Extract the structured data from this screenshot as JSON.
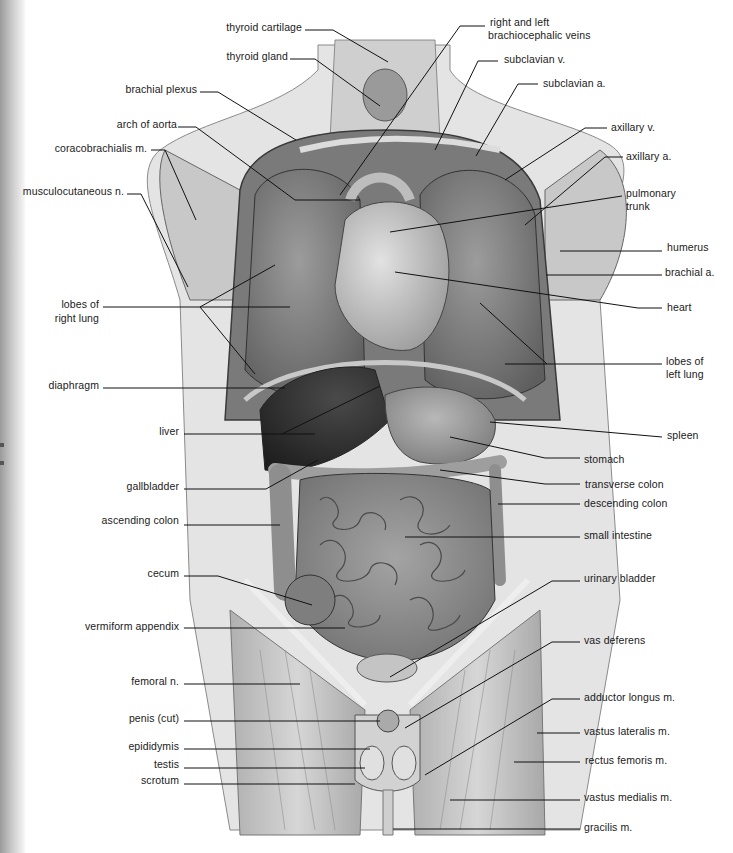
{
  "diagram": {
    "type": "anatomical illustration",
    "colors": {
      "background": "#ffffff",
      "ink": "#1a1a1a",
      "organ_fill": "#8a8a8a",
      "skin": "#d8d8d8"
    }
  },
  "labels_left": [
    {
      "id": "thyroid-cartilage",
      "text": "thyroid cartilage",
      "x": 250,
      "y": 27
    },
    {
      "id": "thyroid-gland",
      "text": "thyroid gland",
      "x": 240,
      "y": 56
    },
    {
      "id": "brachial-plexus",
      "text": "brachial plexus",
      "x": 196,
      "y": 89
    },
    {
      "id": "arch-of-aorta",
      "text": "arch of aorta",
      "x": 176,
      "y": 124
    },
    {
      "id": "coracobrachialis",
      "text": "coracobrachialis m.",
      "x": 146,
      "y": 148
    },
    {
      "id": "musculocutaneous",
      "text": "musculocutaneous n.",
      "x": 124,
      "y": 191
    },
    {
      "id": "lobes-right-lung-1",
      "text": "lobes of",
      "x": 99,
      "y": 304
    },
    {
      "id": "lobes-right-lung-2",
      "text": "right lung",
      "x": 99,
      "y": 318
    },
    {
      "id": "diaphragm",
      "text": "diaphragm",
      "x": 99,
      "y": 385
    },
    {
      "id": "liver",
      "text": "liver",
      "x": 178,
      "y": 431
    },
    {
      "id": "gallbladder",
      "text": "gallbladder",
      "x": 178,
      "y": 486
    },
    {
      "id": "ascending-colon",
      "text": "ascending colon",
      "x": 178,
      "y": 520
    },
    {
      "id": "cecum",
      "text": "cecum",
      "x": 178,
      "y": 573
    },
    {
      "id": "vermiform-appendix",
      "text": "vermiform appendix",
      "x": 178,
      "y": 626
    },
    {
      "id": "femoral-n",
      "text": "femoral n.",
      "x": 178,
      "y": 681
    },
    {
      "id": "penis-cut",
      "text": "penis (cut)",
      "x": 178,
      "y": 718
    },
    {
      "id": "epididymis",
      "text": "epididymis",
      "x": 178,
      "y": 746
    },
    {
      "id": "testis",
      "text": "testis",
      "x": 178,
      "y": 764
    },
    {
      "id": "scrotum",
      "text": "scrotum",
      "x": 178,
      "y": 780
    }
  ],
  "labels_right": [
    {
      "id": "brachiocephalic-veins-1",
      "text": "right and left",
      "x": 490,
      "y": 17
    },
    {
      "id": "brachiocephalic-veins-2",
      "text": "brachiocephalic veins",
      "x": 488,
      "y": 30
    },
    {
      "id": "subclavian-v",
      "text": "subclavian v.",
      "x": 504,
      "y": 54
    },
    {
      "id": "subclavian-a",
      "text": "subclavian a.",
      "x": 543,
      "y": 77
    },
    {
      "id": "axillary-v",
      "text": "axillary v.",
      "x": 611,
      "y": 121
    },
    {
      "id": "axillary-a",
      "text": "axillary a.",
      "x": 626,
      "y": 151
    },
    {
      "id": "pulmonary-trunk-1",
      "text": "pulmonary",
      "x": 626,
      "y": 187
    },
    {
      "id": "pulmonary-trunk-2",
      "text": "trunk",
      "x": 626,
      "y": 200
    },
    {
      "id": "humerus",
      "text": "humerus",
      "x": 667,
      "y": 242
    },
    {
      "id": "brachial-a",
      "text": "brachial a.",
      "x": 665,
      "y": 266
    },
    {
      "id": "heart",
      "text": "heart",
      "x": 667,
      "y": 302
    },
    {
      "id": "lobes-left-lung-1",
      "text": "lobes of",
      "x": 666,
      "y": 356
    },
    {
      "id": "lobes-left-lung-2",
      "text": "left lung",
      "x": 666,
      "y": 369
    },
    {
      "id": "spleen",
      "text": "spleen",
      "x": 667,
      "y": 430
    },
    {
      "id": "stomach",
      "text": "stomach",
      "x": 584,
      "y": 454
    },
    {
      "id": "transverse-colon",
      "text": "transverse colon",
      "x": 585,
      "y": 479
    },
    {
      "id": "descending-colon",
      "text": "descending colon",
      "x": 584,
      "y": 497
    },
    {
      "id": "small-intestine",
      "text": "small intestine",
      "x": 584,
      "y": 529
    },
    {
      "id": "urinary-bladder",
      "text": "urinary bladder",
      "x": 584,
      "y": 572
    },
    {
      "id": "vas-deferens",
      "text": "vas deferens",
      "x": 584,
      "y": 634
    },
    {
      "id": "adductor-longus",
      "text": "adductor longus m.",
      "x": 584,
      "y": 691
    },
    {
      "id": "vastus-lateralis",
      "text": "vastus lateralis m.",
      "x": 584,
      "y": 725
    },
    {
      "id": "rectus-femoris",
      "text": "rectus femoris m.",
      "x": 585,
      "y": 754
    },
    {
      "id": "vastus-medialis",
      "text": "vastus medialis m.",
      "x": 584,
      "y": 791
    },
    {
      "id": "gracilis",
      "text": "gracilis m.",
      "x": 584,
      "y": 821
    }
  ]
}
